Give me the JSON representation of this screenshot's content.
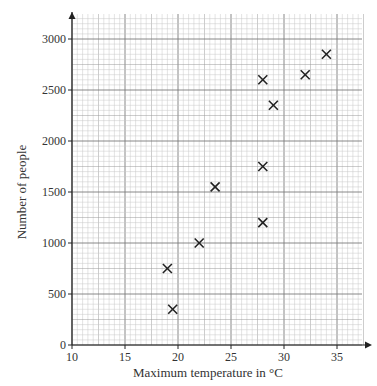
{
  "chart_data": {
    "type": "scatter",
    "title": "",
    "xlabel": "Maximum temperature in °C",
    "ylabel": "Number of people",
    "xlim": [
      10,
      37.5
    ],
    "ylim": [
      0,
      3200
    ],
    "x_ticks": [
      10,
      15,
      20,
      25,
      30,
      35
    ],
    "y_ticks": [
      0,
      500,
      1000,
      1500,
      2000,
      2500,
      3000
    ],
    "grid": true,
    "marker": "x",
    "points": [
      {
        "x": 19,
        "y": 750
      },
      {
        "x": 19.5,
        "y": 350
      },
      {
        "x": 22,
        "y": 1000
      },
      {
        "x": 23.5,
        "y": 1550
      },
      {
        "x": 28,
        "y": 1200
      },
      {
        "x": 28,
        "y": 1750
      },
      {
        "x": 28,
        "y": 2600
      },
      {
        "x": 29,
        "y": 2350
      },
      {
        "x": 32,
        "y": 2650
      },
      {
        "x": 34,
        "y": 2850
      }
    ]
  },
  "labels": {
    "xlabel": "Maximum temperature in °C",
    "ylabel": "Number of people"
  }
}
